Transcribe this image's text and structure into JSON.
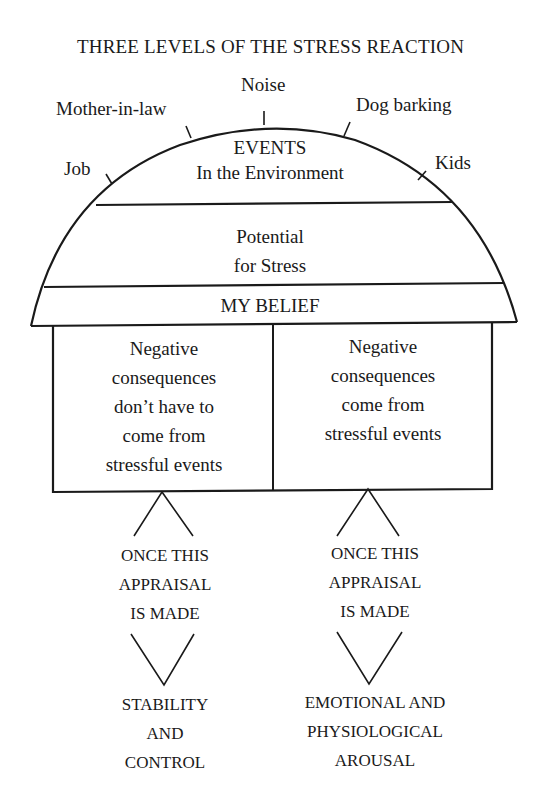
{
  "title": "THREE LEVELS OF THE STRESS REACTION",
  "event_labels": {
    "noise": "Noise",
    "mother_in_law": "Mother-in-law",
    "dog_barking": "Dog barking",
    "job": "Job",
    "kids": "Kids"
  },
  "dome": {
    "events_title": "EVENTS",
    "events_subtitle": "In the Environment",
    "potential_line1": "Potential",
    "potential_line2": "for Stress",
    "belief": "MY BELIEF"
  },
  "beliefs": {
    "left": [
      "Negative",
      "consequences",
      "don’t have to",
      "come from",
      "stressful events"
    ],
    "right": [
      "Negative",
      "consequences",
      "come from",
      "stressful events"
    ]
  },
  "appraisal": {
    "left": [
      "ONCE THIS",
      "APPRAISAL",
      "IS MADE"
    ],
    "right": [
      "ONCE THIS",
      "APPRAISAL",
      "IS MADE"
    ]
  },
  "outcomes": {
    "left": [
      "STABILITY",
      "AND",
      "CONTROL"
    ],
    "right": [
      "EMOTIONAL AND",
      "PHYSIOLOGICAL",
      "AROUSAL"
    ]
  },
  "colors": {
    "ink": "#1a1a1a",
    "background": "#ffffff"
  }
}
